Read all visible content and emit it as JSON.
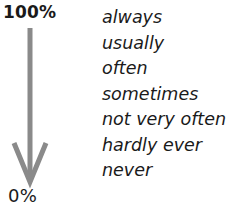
{
  "scale": {
    "top_label": "100%",
    "bottom_label": "0%",
    "arrow_color": "#8a8a8a"
  },
  "frequency_adverbs": [
    {
      "label": "always"
    },
    {
      "label": "usually"
    },
    {
      "label": "often"
    },
    {
      "label": "sometimes"
    },
    {
      "label": "not very often"
    },
    {
      "label": "hardly ever"
    },
    {
      "label": "never"
    }
  ]
}
